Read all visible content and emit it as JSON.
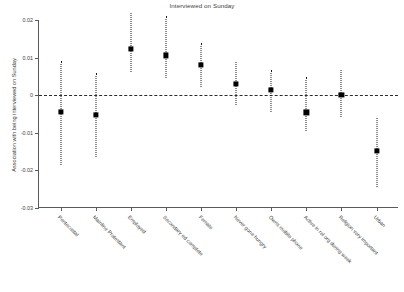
{
  "chart_data": {
    "type": "scatter",
    "title": "Interviewed on Sunday",
    "xlabel": "",
    "ylabel": "Association with being interviewed on Sunday",
    "ylim": [
      -0.03,
      0.02
    ],
    "yticks": [
      0.02,
      0.01,
      0,
      -0.01,
      -0.02,
      -0.03
    ],
    "ytick_labels": [
      "0.02",
      "0.01",
      "0",
      "-0.01",
      "-0.02",
      "-0.03"
    ],
    "grid": false,
    "legend": "none",
    "reference_line": 0,
    "categories": [
      "Pentecostal",
      "Mainline Protestant",
      "Employed",
      "Secondary ed complete",
      "Female",
      "Never gone hungry",
      "Owns mobile phone",
      "Active in rel org during week",
      "Religion very important",
      "Urban"
    ],
    "values": [
      -0.0045,
      -0.0053,
      0.0123,
      0.0106,
      0.008,
      0.0029,
      0.0015,
      -0.0046,
      0.0,
      -0.0148
    ],
    "ci_low": [
      -0.0185,
      -0.0165,
      0.0062,
      0.0047,
      0.0023,
      -0.0026,
      -0.0044,
      -0.0095,
      -0.0058,
      -0.0245
    ],
    "ci_high": [
      0.0092,
      0.006,
      0.0218,
      0.0211,
      0.0138,
      0.0088,
      0.0068,
      0.0048,
      0.0066,
      -0.006
    ]
  }
}
